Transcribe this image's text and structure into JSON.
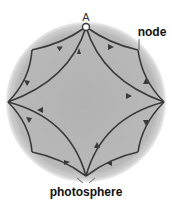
{
  "diagram": {
    "type": "field-line-diagram",
    "labels": {
      "point_a": "A",
      "node": "node",
      "photosphere": "photosphere"
    },
    "colors": {
      "sphere_fill": "#b4b4b4",
      "sphere_halo": "#dcdcdc",
      "line": "#3a3a3a",
      "node_fill": "#ffffff",
      "text": "#111111"
    },
    "geometry": {
      "center": [
        86,
        102
      ],
      "radius": 78,
      "top_node": [
        86,
        27
      ],
      "left_cusp": [
        8,
        102
      ],
      "right_cusp": [
        164,
        102
      ],
      "bottom_cusp": [
        86,
        176
      ],
      "corner_nodes": [
        [
          32,
          50
        ],
        [
          138,
          50
        ],
        [
          32,
          152
        ],
        [
          138,
          152
        ]
      ]
    }
  }
}
